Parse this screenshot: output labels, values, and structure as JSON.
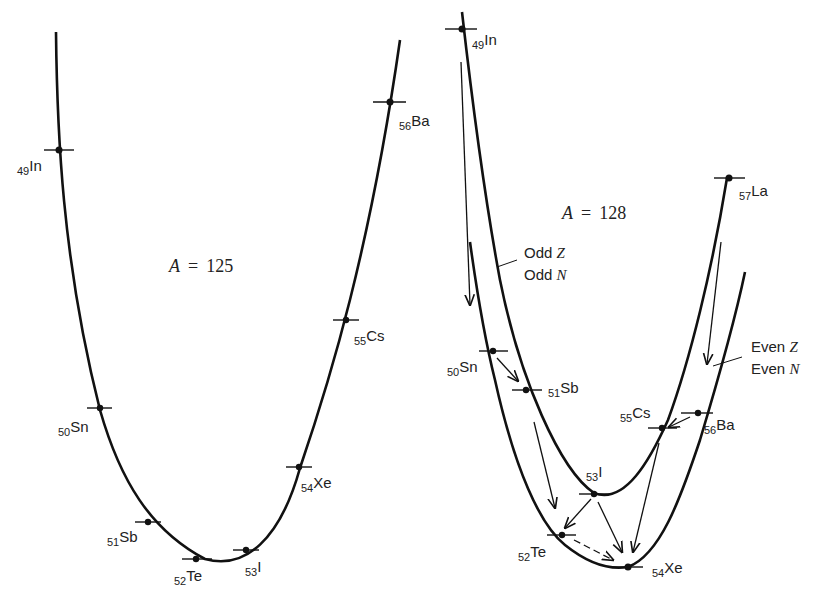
{
  "panels": [
    {
      "id": "a125",
      "title_var": "A",
      "title_eq": "=",
      "title_val": "125",
      "nuclides": [
        {
          "z": "49",
          "sym": "In"
        },
        {
          "z": "50",
          "sym": "Sn"
        },
        {
          "z": "51",
          "sym": "Sb"
        },
        {
          "z": "52",
          "sym": "Te"
        },
        {
          "z": "53",
          "sym": "I"
        },
        {
          "z": "54",
          "sym": "Xe"
        },
        {
          "z": "55",
          "sym": "Cs"
        },
        {
          "z": "56",
          "sym": "Ba"
        }
      ]
    },
    {
      "id": "a128",
      "title_var": "A",
      "title_eq": "=",
      "title_val": "128",
      "legend_odd": [
        "Odd",
        "Z",
        "Odd",
        "N"
      ],
      "legend_even": [
        "Even",
        "Z",
        "Even",
        "N"
      ],
      "nuclides": [
        {
          "z": "49",
          "sym": "In"
        },
        {
          "z": "50",
          "sym": "Sn"
        },
        {
          "z": "51",
          "sym": "Sb"
        },
        {
          "z": "52",
          "sym": "Te"
        },
        {
          "z": "53",
          "sym": "I"
        },
        {
          "z": "54",
          "sym": "Xe"
        },
        {
          "z": "55",
          "sym": "Cs"
        },
        {
          "z": "56",
          "sym": "Ba"
        },
        {
          "z": "57",
          "sym": "La"
        }
      ],
      "decays": [
        {
          "from": "In",
          "to": "Sn"
        },
        {
          "from": "Sn",
          "to": "Sb"
        },
        {
          "from": "Sb",
          "to": "Te"
        },
        {
          "from": "I",
          "to": "Te"
        },
        {
          "from": "I",
          "to": "Xe"
        },
        {
          "from": "Te",
          "to": "Xe",
          "style": "dashed"
        },
        {
          "from": "La",
          "to": "Ba"
        },
        {
          "from": "Ba",
          "to": "Cs"
        },
        {
          "from": "Cs",
          "to": "Xe"
        }
      ]
    }
  ]
}
